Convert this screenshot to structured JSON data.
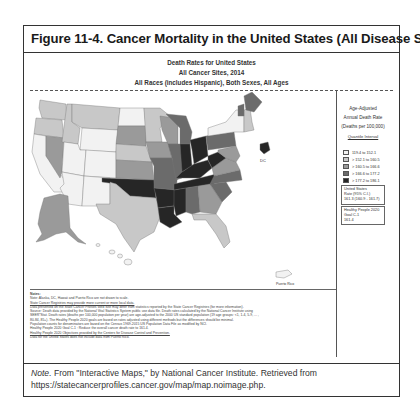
{
  "figure": {
    "title": "Figure 11-4. Cancer Mortality in the United States (All Disease Sites)",
    "header": {
      "line1": "Death Rates for United States",
      "line2": "All Cancer Sites, 2014",
      "line3": "All Races (includes Hispanic), Both Sexes, All Ages"
    },
    "map": {
      "labels": {
        "dc": "DC",
        "puerto_rico": "Puerto Rico"
      }
    },
    "legend": {
      "title_line1": "Age-Adjusted",
      "title_line2": "Annual Death Rate",
      "title_line3": "(Deaths per 100,000)",
      "interval_link": "Quantile Interval",
      "items": [
        {
          "label": "119.4 to 152.1",
          "color": "#f2f2f2"
        },
        {
          "label": "> 152.1 to 160.5",
          "color": "#c8c8c8"
        },
        {
          "label": "> 160.5 to 166.6",
          "color": "#9a9a9a"
        },
        {
          "label": "> 166.6 to 177.2",
          "color": "#6b6b6b"
        },
        {
          "label": "> 177.2 to 186.1",
          "color": "#262626"
        }
      ],
      "us_rate": {
        "line1": "United States",
        "line2": "Rate (95% C.I.)",
        "line3": "161.3 (160.9 - 161.7)"
      },
      "healthy_people": {
        "line1": "Healthy People 2020",
        "line2": "Goal C-1",
        "line3": "161.4"
      }
    },
    "notes": {
      "heading": "Notes:",
      "lines": [
        "Note: Alaska, DC, Hawaii and Puerto Rico are not drawn to scale.",
        "State Cancer Registries may provide more current or more local data.",
        "Data presented on the State Cancer Profiles Web Site may differ from statistics reported by the State Cancer Registries (for more information).",
        "Source: Death data provided by the National Vital Statistics System public use data file. Death rates calculated by the National Cancer Institute using",
        "SEER*Stat. Death rates (deaths per 100,000 population per year) are age-adjusted to the 2000 US standard population (19 age groups: <1, 1-4, 5-9, ... ,",
        "80-84, 85+). The Healthy People 2020 goals are based on rates adjusted using different methods but the differences should be minimal.",
        "Population counts for denominators are based on the Census 1969-2015 US Population Data File as modified by NCI.",
        "Healthy People 2020 Goal C-1 : Reduce the overall cancer death rate to 161.4.",
        "Healthy People 2020 Objectives provided by the Centers for Disease Control and Prevention.",
        "Data for the United States does not include data from Puerto Rico."
      ]
    },
    "caption": {
      "note_label": "Note.",
      "text": " From \"Interactive Maps,\" by National Cancer Institute. Retrieved from https://statecancerprofiles.cancer.gov/map/map.noimage.php."
    }
  }
}
